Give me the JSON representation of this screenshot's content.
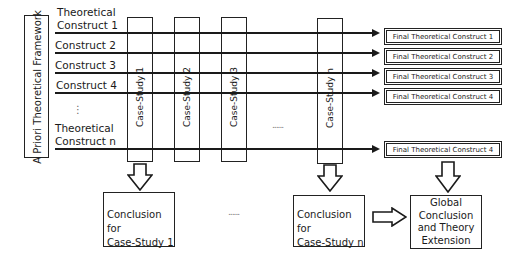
{
  "framework": {
    "label": "A Priori Theoretical Framework"
  },
  "constructs": [
    {
      "label": "Theoretical Construct 1",
      "line1": "Theoretical",
      "line2": "Construct 1"
    },
    {
      "label": "Construct 2"
    },
    {
      "label": "Construct  3"
    },
    {
      "label": "Construct  4"
    },
    {
      "label": "Theoretical Construct n",
      "line1": "Theoretical",
      "line2": "Construct n"
    }
  ],
  "vertical_ellipsis": "⋮",
  "case_studies": [
    {
      "label": "Case-Study 1"
    },
    {
      "label": "Case-Study  2"
    },
    {
      "label": "Case-Study 3"
    },
    {
      "label": "Case-Study n"
    }
  ],
  "case_ellipsis": "......",
  "final_constructs": [
    {
      "label": "Final Theoretical Construct 1"
    },
    {
      "label": "Final Theoretical Construct  2"
    },
    {
      "label": "Final Theoretical Construct  3"
    },
    {
      "label": "Final Theoretical Construct  4"
    },
    {
      "label": "Final Theoretical Construct  4"
    }
  ],
  "conclusions": {
    "cs1": {
      "line1": "Conclusion for",
      "line2": "Case-Study 1"
    },
    "csn": {
      "line1": "Conclusion for",
      "line2": "Case-Study n"
    },
    "ellipsis": "......",
    "global": {
      "line1": "Global",
      "line2": "Conclusion",
      "line3": "and Theory",
      "line4": "Extension"
    }
  }
}
